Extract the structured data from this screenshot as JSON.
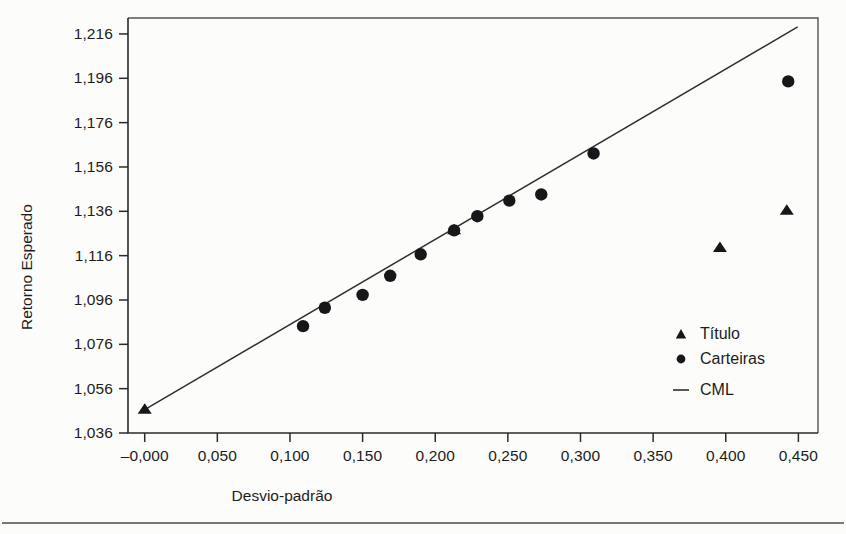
{
  "figure": {
    "background_color": "#fcfcfa",
    "axis_color": "#2b2b2b",
    "marker_color": "#17171a",
    "line_color": "#2f2f2f"
  },
  "chart_data": {
    "type": "scatter",
    "title": "",
    "xlabel": "Desvio-padrão",
    "ylabel": "Retorno Esperado",
    "xlim": [
      -0.0115,
      0.4635
    ],
    "ylim": [
      1.036,
      1.2232
    ],
    "xticks": [
      0.0,
      0.05,
      0.1,
      0.15,
      0.2,
      0.25,
      0.3,
      0.35,
      0.4,
      0.45
    ],
    "xticklabels": [
      "–0,000",
      "0,050",
      "0,100",
      "0,150",
      "0,200",
      "0,250",
      "0,300",
      "0,350",
      "0,400",
      "0,450"
    ],
    "yticks": [
      1.036,
      1.056,
      1.076,
      1.096,
      1.116,
      1.136,
      1.156,
      1.176,
      1.196,
      1.216
    ],
    "yticklabels": [
      "1,036",
      "1,056",
      "1,076",
      "1,096",
      "1,116",
      "1,136",
      "1,156",
      "1,176",
      "1,196",
      "1,216"
    ],
    "grid": false,
    "legend_position": "lower-right-inside",
    "series": [
      {
        "name": "Título",
        "marker": "triangle",
        "points": [
          {
            "x": 0.0,
            "y": 1.0465
          },
          {
            "x": 0.213,
            "y": 1.1274
          },
          {
            "x": 0.396,
            "y": 1.1194
          },
          {
            "x": 0.442,
            "y": 1.1362
          }
        ]
      },
      {
        "name": "Carteiras",
        "marker": "circle",
        "points": [
          {
            "x": 0.109,
            "y": 1.0842
          },
          {
            "x": 0.124,
            "y": 1.0925
          },
          {
            "x": 0.15,
            "y": 1.0983
          },
          {
            "x": 0.169,
            "y": 1.1069
          },
          {
            "x": 0.19,
            "y": 1.1166
          },
          {
            "x": 0.213,
            "y": 1.1274
          },
          {
            "x": 0.229,
            "y": 1.1338
          },
          {
            "x": 0.251,
            "y": 1.1408
          },
          {
            "x": 0.273,
            "y": 1.1436
          },
          {
            "x": 0.309,
            "y": 1.1621
          },
          {
            "x": 0.443,
            "y": 1.1946
          }
        ]
      },
      {
        "name": "CML",
        "marker": "line",
        "line": {
          "x0": 0.0,
          "y0": 1.0465,
          "x1": 0.4495,
          "y1": 1.2192
        }
      }
    ],
    "legend_entries": [
      {
        "label": "Título",
        "marker": "triangle"
      },
      {
        "label": "Carteiras",
        "marker": "circle"
      },
      {
        "label": "CML",
        "marker": "line"
      }
    ]
  }
}
